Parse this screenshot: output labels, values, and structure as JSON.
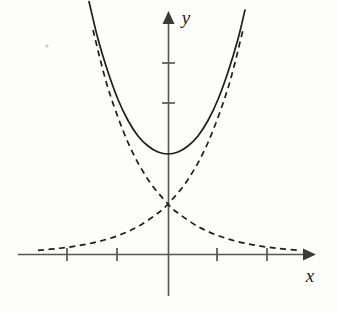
{
  "figure": {
    "background_color": "#fdfdfb",
    "curve_color": "#1d1d1d",
    "axis_color": "#555555"
  },
  "axes": {
    "x_axis": {
      "label": "x",
      "name": "x-axis",
      "y_pixel": 254,
      "x_start": 18,
      "x_end": 312,
      "arrow": "right-arrow",
      "label_x": 310,
      "label_y": 281
    },
    "y_axis": {
      "label": "y",
      "name": "y-axis",
      "x_pixel": 168,
      "y_top": 14,
      "y_bottom": 296,
      "arrow": "up-arrow",
      "label_x": 186,
      "label_y": 24
    },
    "x_ticks": [
      67,
      117,
      217,
      267
    ],
    "y_ticks": [
      63,
      103
    ],
    "tick_half_length_x": 6,
    "tick_half_length_y": 6
  },
  "chart_data": {
    "type": "line",
    "title": "",
    "xlabel": "x",
    "ylabel": "y",
    "grid": false,
    "legend": "none",
    "xlim": [
      -3.0,
      2.88
    ],
    "ylim": [
      -0.84,
      4.84
    ],
    "origin_pixel": [
      168,
      254
    ],
    "pixels_per_unit_x": 50,
    "pixels_per_unit_y": 50,
    "annotations": [
      "solid curve is the sum of the two dashed curves",
      "dashed curves cross at x = 0, y = 1",
      "solid curve minimum at x = 0, y = 2"
    ],
    "series": [
      {
        "name": "cosh-curve",
        "style": "solid",
        "formula": "y = e^x + e^-x",
        "vertex": [
          0,
          2
        ],
        "x": [
          -1.58,
          -1.4,
          -1.2,
          -1.0,
          -0.8,
          -0.6,
          -0.4,
          -0.2,
          0,
          0.2,
          0.4,
          0.6,
          0.8,
          1.0,
          1.2,
          1.4,
          1.54
        ],
        "y": [
          5.05,
          4.3,
          3.64,
          3.09,
          2.67,
          2.36,
          2.16,
          2.04,
          2.0,
          2.04,
          2.16,
          2.36,
          2.67,
          3.09,
          3.64,
          4.3,
          4.88
        ]
      },
      {
        "name": "exponential-growth-curve",
        "style": "dashed",
        "formula": "y = e^x",
        "x": [
          -2.6,
          -2.2,
          -1.8,
          -1.4,
          -1.0,
          -0.6,
          -0.2,
          0,
          0.4,
          0.8,
          1.2,
          1.5
        ],
        "y": [
          0.074,
          0.111,
          0.165,
          0.247,
          0.368,
          0.549,
          0.819,
          1.0,
          1.49,
          2.23,
          3.32,
          4.48
        ]
      },
      {
        "name": "exponential-decay-curve",
        "style": "dashed",
        "formula": "y = e^-x",
        "x": [
          -1.5,
          -1.2,
          -0.8,
          -0.4,
          0,
          0.2,
          0.6,
          1.0,
          1.4,
          1.8,
          2.2,
          2.6
        ],
        "y": [
          4.48,
          3.32,
          2.23,
          1.49,
          1.0,
          0.819,
          0.549,
          0.368,
          0.247,
          0.165,
          0.111,
          0.074
        ]
      }
    ]
  }
}
